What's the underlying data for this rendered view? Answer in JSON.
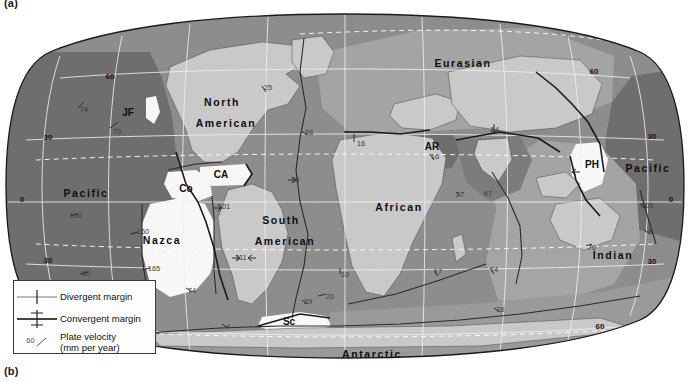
{
  "figure": {
    "panel_a_label": "(a)",
    "panel_b_label": "(b)"
  },
  "legend": {
    "items": [
      {
        "symbol": "divergent-margin-symbol",
        "label": "Divergent margin"
      },
      {
        "symbol": "convergent-margin-symbol",
        "label": "Convergent margin"
      },
      {
        "symbol": "plate-velocity-symbol",
        "label": "Plate velocity",
        "sublabel": "(mm per year)",
        "value": "60"
      }
    ]
  },
  "map": {
    "projection": "elliptical-world",
    "plates": [
      {
        "name": "Pacific",
        "x": 86,
        "y": 185,
        "size": 10.5
      },
      {
        "name": "Pacific",
        "x": 648,
        "y": 160,
        "size": 10.5
      },
      {
        "name": "North",
        "x": 222,
        "y": 94,
        "size": 10.5
      },
      {
        "name": "American",
        "x": 226,
        "y": 115,
        "size": 10.5
      },
      {
        "name": "South",
        "x": 281,
        "y": 212,
        "size": 10.5
      },
      {
        "name": "American",
        "x": 285,
        "y": 233,
        "size": 10.5
      },
      {
        "name": "Eurasian",
        "x": 463,
        "y": 55,
        "size": 10.5
      },
      {
        "name": "African",
        "x": 399,
        "y": 199,
        "size": 10.5
      },
      {
        "name": "Indian",
        "x": 613,
        "y": 247,
        "size": 10.5
      },
      {
        "name": "Antarctic",
        "x": 372,
        "y": 346,
        "size": 10.5
      },
      {
        "name": "Nazca",
        "x": 162,
        "y": 232,
        "size": 10.5
      },
      {
        "name": "Co",
        "x": 186,
        "y": 177,
        "size": 9.5
      },
      {
        "name": "CA",
        "x": 221,
        "y": 163,
        "size": 9.5
      },
      {
        "name": "JF",
        "x": 128,
        "y": 101,
        "size": 9.5
      },
      {
        "name": "AR",
        "x": 432,
        "y": 135,
        "size": 9.5
      },
      {
        "name": "PH",
        "x": 592,
        "y": 153,
        "size": 9.5
      },
      {
        "name": "Sc",
        "x": 289,
        "y": 310,
        "size": 9.5
      }
    ],
    "plate_abbreviations": [
      {
        "code": "JF",
        "expansion": "Juan de Fuca"
      },
      {
        "code": "Co",
        "expansion": "Cocos"
      },
      {
        "code": "CA",
        "expansion": "Caribbean"
      },
      {
        "code": "AR",
        "expansion": "Arabian"
      },
      {
        "code": "PH",
        "expansion": "Philippine"
      },
      {
        "code": "Sc",
        "expansion": "Scotia"
      }
    ],
    "latitude_labels": [
      {
        "text": "60",
        "x": 110,
        "y": 67
      },
      {
        "text": "30",
        "x": 48,
        "y": 128
      },
      {
        "text": "0",
        "x": 22,
        "y": 190
      },
      {
        "text": "30",
        "x": 48,
        "y": 251
      },
      {
        "text": "60",
        "x": 110,
        "y": 315
      },
      {
        "text": "60",
        "x": 594,
        "y": 62
      },
      {
        "text": "30",
        "x": 652,
        "y": 127
      },
      {
        "text": "0",
        "x": 671,
        "y": 190
      },
      {
        "text": "30",
        "x": 652,
        "y": 252
      },
      {
        "text": "60",
        "x": 600,
        "y": 317
      }
    ],
    "velocity_labels": [
      {
        "value": "74",
        "x": 84,
        "y": 100
      },
      {
        "value": "70",
        "x": 117,
        "y": 122
      },
      {
        "value": "100",
        "x": 76,
        "y": 206
      },
      {
        "value": "80",
        "x": 86,
        "y": 264
      },
      {
        "value": "160",
        "x": 143,
        "y": 222
      },
      {
        "value": "165",
        "x": 154,
        "y": 259
      },
      {
        "value": "101",
        "x": 224,
        "y": 197
      },
      {
        "value": "111",
        "x": 241,
        "y": 248
      },
      {
        "value": "74",
        "x": 192,
        "y": 281
      },
      {
        "value": "4",
        "x": 228,
        "y": 317
      },
      {
        "value": "25",
        "x": 268,
        "y": 78
      },
      {
        "value": "28",
        "x": 309,
        "y": 123
      },
      {
        "value": "38",
        "x": 295,
        "y": 170
      },
      {
        "value": "16",
        "x": 361,
        "y": 134
      },
      {
        "value": "10",
        "x": 345,
        "y": 265
      },
      {
        "value": "29",
        "x": 308,
        "y": 292
      },
      {
        "value": "20",
        "x": 330,
        "y": 287
      },
      {
        "value": "16",
        "x": 435,
        "y": 147
      },
      {
        "value": "54",
        "x": 495,
        "y": 120
      },
      {
        "value": "27",
        "x": 460,
        "y": 185
      },
      {
        "value": "67",
        "x": 488,
        "y": 184
      },
      {
        "value": "17",
        "x": 438,
        "y": 262
      },
      {
        "value": "74",
        "x": 494,
        "y": 260
      },
      {
        "value": "70",
        "x": 592,
        "y": 238
      },
      {
        "value": "78",
        "x": 500,
        "y": 300
      },
      {
        "value": "105",
        "x": 647,
        "y": 196
      },
      {
        "value": "8",
        "x": 650,
        "y": 222
      }
    ]
  },
  "colors": {
    "ocean_dark": "#6f6f6f",
    "ocean_mid": "#8d8d8d",
    "ocean_light": "#a5a5a5",
    "land_light": "#c9c9c9",
    "land_white": "#f7f7f7",
    "grid": "#f0f0f0",
    "outline": "#1a1a1a",
    "legend_bg": "#fdfdfd"
  }
}
